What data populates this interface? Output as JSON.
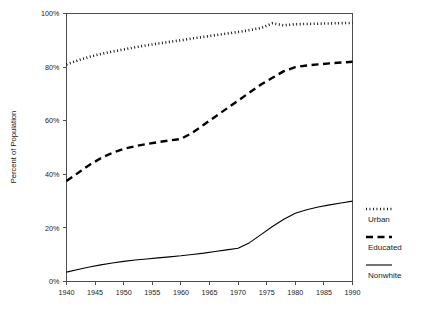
{
  "chart_data": {
    "type": "line",
    "title": "",
    "xlabel": "",
    "ylabel": "Percent of Population",
    "xlim": [
      1940,
      1990
    ],
    "ylim": [
      0,
      100
    ],
    "grid": false,
    "legend_position": "right",
    "x_tick_labels": [
      "1940",
      "1945",
      "1950",
      "1955",
      "1960",
      "1965",
      "1970",
      "1975",
      "1980",
      "1985",
      "1990"
    ],
    "x_ticks": [
      1940,
      1945,
      1950,
      1955,
      1960,
      1965,
      1970,
      1975,
      1980,
      1985,
      1990
    ],
    "y_tick_labels": [
      "0%",
      "20%",
      "40%",
      "60%",
      "80%",
      "100%"
    ],
    "y_ticks": [
      0,
      20,
      40,
      60,
      80,
      100
    ],
    "x": [
      1940,
      1942,
      1944,
      1946,
      1948,
      1950,
      1952,
      1954,
      1956,
      1958,
      1960,
      1962,
      1964,
      1966,
      1968,
      1970,
      1972,
      1974,
      1976,
      1978,
      1980,
      1982,
      1984,
      1986,
      1988,
      1990
    ],
    "series": [
      {
        "name": "Urban",
        "style": "dotted",
        "color": "#000000",
        "values": [
          81.0,
          82.5,
          83.8,
          84.9,
          85.8,
          86.6,
          87.4,
          88.1,
          88.8,
          89.4,
          90.0,
          90.7,
          91.3,
          91.9,
          92.5,
          93.1,
          93.8,
          94.6,
          96.3,
          95.6,
          96.0,
          96.1,
          96.2,
          96.3,
          96.4,
          96.5
        ]
      },
      {
        "name": "Educated",
        "style": "dashed",
        "color": "#000000",
        "values": [
          37.5,
          40.5,
          43.5,
          46.0,
          48.0,
          49.5,
          50.5,
          51.3,
          52.0,
          52.6,
          53.2,
          55.5,
          58.5,
          61.5,
          64.5,
          67.5,
          70.5,
          73.5,
          76.0,
          78.5,
          80.0,
          80.6,
          81.0,
          81.4,
          81.7,
          82.0
        ]
      },
      {
        "name": "Nonwhite",
        "style": "solid",
        "color": "#000000",
        "values": [
          3.5,
          4.5,
          5.4,
          6.2,
          6.9,
          7.5,
          8.0,
          8.4,
          8.8,
          9.2,
          9.6,
          10.1,
          10.6,
          11.2,
          11.8,
          12.4,
          14.5,
          17.5,
          20.5,
          23.2,
          25.5,
          26.8,
          27.8,
          28.6,
          29.3,
          30.0
        ]
      }
    ]
  },
  "legend": {
    "items": [
      {
        "label": "Urban",
        "style": "dotted"
      },
      {
        "label": "Educated",
        "style": "dashed"
      },
      {
        "label": "Nonwhite",
        "style": "solid"
      }
    ]
  }
}
